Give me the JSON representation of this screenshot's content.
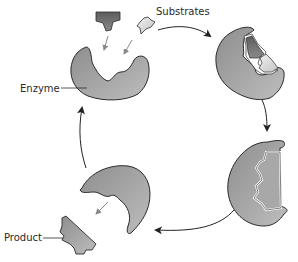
{
  "diagram": {
    "type": "enzyme-catalytic-cycle",
    "labels": {
      "substrates": "Substrates",
      "enzyme": "Enzyme",
      "product": "Product"
    },
    "stages": [
      {
        "id": "free-enzyme-with-substrates",
        "position": "top-left"
      },
      {
        "id": "enzyme-substrate-binding",
        "position": "top-right"
      },
      {
        "id": "enzyme-substrate-complex",
        "position": "bottom-right"
      },
      {
        "id": "enzyme-releasing-product",
        "position": "bottom-left"
      }
    ],
    "colors": {
      "enzyme_fill": "#9a9a9a",
      "enzyme_fill_light": "#b8b8b8",
      "substrate_dark": "#6e6e6e",
      "substrate_light": "#d8d8d8",
      "outline": "#2b2b2b",
      "small_arrow": "#8a8a8a",
      "cycle_arrow": "#222222"
    }
  }
}
